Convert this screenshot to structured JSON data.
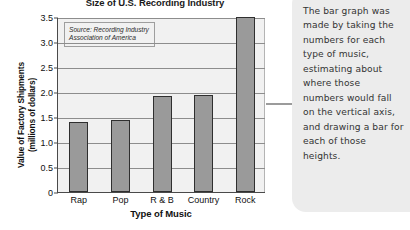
{
  "chart_data": {
    "type": "bar",
    "title": "Size of U.S. Recording Industry",
    "xlabel": "Type of Music",
    "ylabel_line1": "Value of Factory Shipments",
    "ylabel_line2": "(millions of dollars)",
    "categories": [
      "Rap",
      "Pop",
      "R & B",
      "Country",
      "Rock"
    ],
    "values": [
      1.4,
      1.45,
      1.93,
      1.95,
      3.5
    ],
    "ylim": [
      0,
      3.5
    ],
    "yticks": [
      "0",
      "0.5",
      "1.0",
      "1.5",
      "2.0",
      "2.5",
      "3.0",
      "3.5"
    ],
    "ytick_values": [
      0,
      0.5,
      1.0,
      1.5,
      2.0,
      2.5,
      3.0,
      3.5
    ],
    "grid": true,
    "legend": "none",
    "annotation_line1": "Source: Recording Industry",
    "annotation_line2": "Association of America",
    "bar_fill_color": "#9a9a9a",
    "bar_edge_color": "#2f2f2f",
    "plot_background_color": "#f1f1f1"
  },
  "callout": {
    "text": "The bar graph was made by taking the numbers for each type of music, estimating about where those numbers would fall on the vertical axis, and drawing a bar for each of those heights.",
    "background_color": "#ececec",
    "leader_line_color": "#9b9b9b"
  }
}
